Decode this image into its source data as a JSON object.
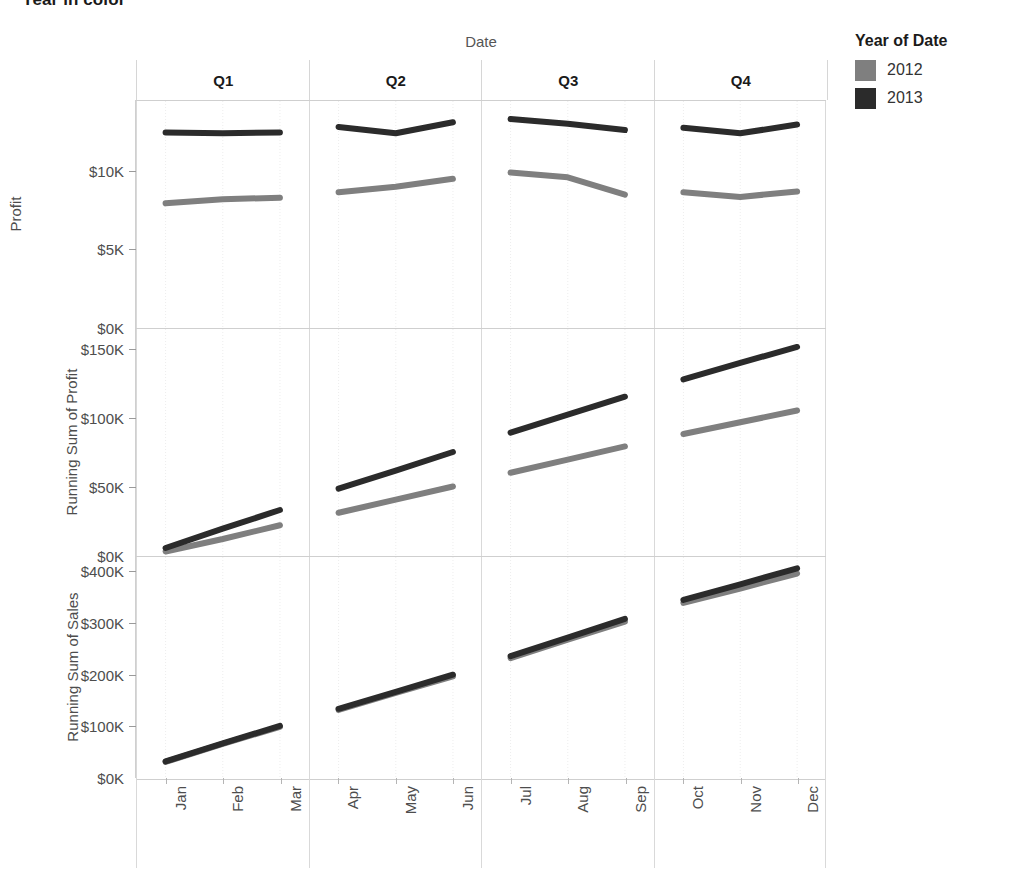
{
  "title": "Year in color",
  "legend": {
    "title": "Year of Date",
    "items": [
      {
        "label": "2012",
        "color": "#7f7f7f"
      },
      {
        "label": "2013",
        "color": "#2b2b2b"
      }
    ]
  },
  "columns": {
    "header_title": "Date",
    "quarters": [
      "Q1",
      "Q2",
      "Q3",
      "Q4"
    ],
    "months": [
      "Jan",
      "Feb",
      "Mar",
      "Apr",
      "May",
      "Jun",
      "Jul",
      "Aug",
      "Sep",
      "Oct",
      "Nov",
      "Dec"
    ]
  },
  "rows": [
    {
      "axis_title": "Profit",
      "ticks": [
        "$10K",
        "$5K",
        "$0K"
      ],
      "tick_values": [
        10000,
        5000,
        0
      ],
      "ylim": [
        0,
        14500
      ]
    },
    {
      "axis_title": "Running Sum of Profit",
      "ticks": [
        "$150K",
        "$100K",
        "$50K",
        "$0K"
      ],
      "tick_values": [
        150000,
        100000,
        50000,
        0
      ],
      "ylim": [
        0,
        165000
      ]
    },
    {
      "axis_title": "Running Sum of Sales",
      "ticks": [
        "$400K",
        "$300K",
        "$200K",
        "$100K",
        "$0K"
      ],
      "tick_values": [
        400000,
        300000,
        200000,
        100000,
        0
      ],
      "ylim": [
        0,
        430000
      ]
    }
  ],
  "chart_data": {
    "type": "line",
    "title": "Year in color",
    "xlabel": "Date",
    "grid": true,
    "legend_position": "right",
    "legend_title": "Year of Date",
    "trellis": {
      "rows": 3,
      "columns": 4
    },
    "x": [
      "Jan",
      "Feb",
      "Mar",
      "Apr",
      "May",
      "Jun",
      "Jul",
      "Aug",
      "Sep",
      "Oct",
      "Nov",
      "Dec"
    ],
    "column_groups": [
      "Q1",
      "Q2",
      "Q3",
      "Q4"
    ],
    "panels": [
      {
        "measure": "Profit",
        "ylabel": "Profit",
        "ylim": [
          0,
          14500
        ],
        "ytick_labels": [
          "$0K",
          "$5K",
          "$10K"
        ],
        "series": [
          {
            "name": "2012",
            "color": "#7f7f7f",
            "values": [
              8000,
              8250,
              8350,
              8700,
              9050,
              9550,
              9950,
              9650,
              8550,
              8700,
              8400,
              8750
            ]
          },
          {
            "name": "2013",
            "color": "#2b2b2b",
            "values": [
              12500,
              12450,
              12500,
              12850,
              12450,
              13150,
              13350,
              13050,
              12650,
              12800,
              12450,
              13000
            ]
          }
        ]
      },
      {
        "measure": "Running Sum of Profit",
        "ylabel": "Running Sum of Profit",
        "ylim": [
          0,
          165000
        ],
        "ytick_labels": [
          "$0K",
          "$50K",
          "$100K",
          "$150K"
        ],
        "series": [
          {
            "name": "2012",
            "color": "#7f7f7f",
            "values": [
              4000,
              13000,
              23000,
              32000,
              41500,
              51000,
              61000,
              70500,
              80000,
              89000,
              97500,
              106000
            ]
          },
          {
            "name": "2013",
            "color": "#2b2b2b",
            "values": [
              6500,
              20500,
              34000,
              49500,
              62500,
              76000,
              90000,
              103000,
              116000,
              128500,
              140500,
              152000
            ]
          }
        ]
      },
      {
        "measure": "Running Sum of Sales",
        "ylabel": "Running Sum of Sales",
        "ylim": [
          0,
          430000
        ],
        "ytick_labels": [
          "$0K",
          "$100K",
          "$200K",
          "$300K",
          "$400K"
        ],
        "series": [
          {
            "name": "2012",
            "color": "#7f7f7f",
            "values": [
              33000,
              68000,
              101000,
              134000,
              167000,
              199000,
              234000,
              270000,
              305000,
              341000,
              369000,
              398000
            ]
          },
          {
            "name": "2013",
            "color": "#2b2b2b",
            "values": [
              34000,
              69000,
              103000,
              136000,
              169000,
              202000,
              238000,
              274000,
              310000,
              347000,
              377000,
              408000
            ]
          }
        ]
      }
    ]
  }
}
